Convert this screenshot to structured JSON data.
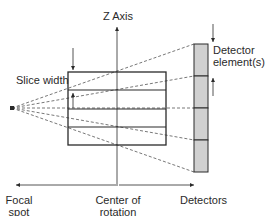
{
  "diagram": {
    "labels": {
      "z_axis": "Z Axis",
      "slice_width": "Slice width",
      "detector_element": "Detector element(s)",
      "focal_spot": [
        "Focal",
        "spot"
      ],
      "center_of_rotation": [
        "Center of",
        "rotation"
      ],
      "detectors": "Detectors"
    },
    "slice_rows": 4,
    "detector_elements": 4,
    "colors": {
      "line": "#2a2a2a",
      "dashed": "#555555",
      "detector_fill": "#d0d0d0"
    }
  }
}
